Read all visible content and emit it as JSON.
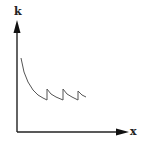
{
  "chart_data": {
    "type": "line",
    "title": "",
    "xlabel": "x",
    "ylabel": "k",
    "grid": false,
    "legend": null,
    "ticks": {
      "x": [],
      "y": []
    },
    "series": [
      {
        "name": "k(x)",
        "points_px": [
          [
            21,
            58
          ],
          [
            24,
            72
          ],
          [
            28,
            82
          ],
          [
            33,
            90
          ],
          [
            38,
            95
          ],
          [
            43,
            98
          ],
          [
            47,
            100
          ],
          [
            47,
            89
          ],
          [
            51,
            94
          ],
          [
            56,
            97
          ],
          [
            63,
            100
          ],
          [
            63,
            89
          ],
          [
            67,
            94
          ],
          [
            72,
            97
          ],
          [
            78,
            100
          ],
          [
            78,
            91
          ],
          [
            82,
            95
          ],
          [
            86,
            97
          ]
        ]
      }
    ],
    "axis_origin_px": [
      17,
      132
    ],
    "colors": {
      "axis": "#222222",
      "curve": "#555555"
    }
  },
  "labels": {
    "y": "k",
    "x": "x"
  }
}
